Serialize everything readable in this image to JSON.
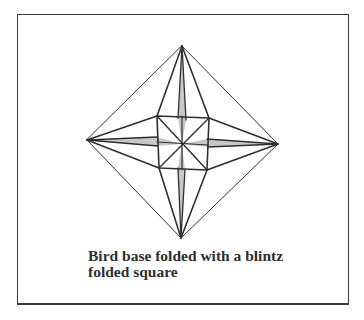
{
  "diagram": {
    "title": "Bird base folded with a blintz folded square",
    "caption_lines": [
      "Bird base folded with a blintz",
      "folded square"
    ],
    "colors": {
      "line": "#2f2f2f",
      "shaded_flap": "#c8c8c8",
      "frame": "#3a3a3a",
      "background": "#ffffff"
    },
    "points": {
      "top": [
        182,
        46
      ],
      "left": [
        87,
        140
      ],
      "right": [
        278,
        144
      ],
      "bottom": [
        181,
        238
      ],
      "center": [
        182,
        144
      ],
      "inner_tl": [
        157,
        116
      ],
      "inner_tr": [
        209,
        118
      ],
      "inner_br": [
        207,
        170
      ],
      "inner_bl": [
        159,
        168
      ]
    }
  }
}
